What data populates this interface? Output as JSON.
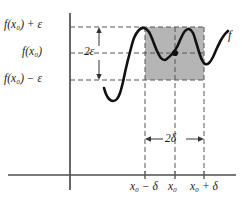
{
  "figure": {
    "curve_label": "f",
    "axes": {
      "x_axis_name": "x-axis",
      "y_axis_name": "y-axis"
    },
    "colors": {
      "shaded_band": "#b5b5b5",
      "curve": "#111111",
      "axis": "#4d4d4d",
      "dashed_guide": "#555555",
      "text": "#1a1a1a"
    },
    "y_labels": {
      "upper": "f(x₀) + ε",
      "center": "f(x₀)",
      "lower": "f(x₀) − ε"
    },
    "x_labels": {
      "left": "x₀ − δ",
      "center": "x₀",
      "right": "x₀ + δ"
    },
    "annotations": {
      "vertical_extent": "2ε",
      "horizontal_extent": "2δ"
    },
    "marked_point": {
      "name": "point-x0-fx0",
      "x_label": "x₀",
      "y_label": "f(x₀)"
    }
  },
  "chart_data": {
    "type": "line",
    "xlabel": "",
    "ylabel": "",
    "grid": false,
    "legend": "none",
    "xlim": [
      0,
      245
    ],
    "ylim": [
      205,
      0
    ],
    "axis_pixels": {
      "x_axis_y": 175,
      "y_axis_x": 70,
      "y_axis_top": 13,
      "y_axis_bottom": 190,
      "x_axis_left": 8,
      "x_axis_right": 236
    },
    "guides": {
      "y_upper": 27,
      "y_center": 53,
      "y_lower": 80,
      "x_left": 145,
      "x_center": 175,
      "x_right": 204
    },
    "shaded_rect": {
      "x": 145,
      "y": 27,
      "width": 59,
      "height": 53
    },
    "ticks": {
      "x": [
        145,
        175,
        204
      ],
      "x_tick_labels": [
        "x₀ − δ",
        "x₀",
        "x₀ + δ"
      ],
      "y_tick_labels": [
        "f(x₀) − ε",
        "f(x₀)",
        "f(x₀) + ε"
      ]
    },
    "series": [
      {
        "name": "f",
        "comment": "oscillating curve; pixel path points (x,y)",
        "points": [
          [
            104,
            88
          ],
          [
            106,
            94
          ],
          [
            109,
            99
          ],
          [
            113,
            101
          ],
          [
            117,
            99
          ],
          [
            120,
            93
          ],
          [
            123,
            82
          ],
          [
            126,
            68
          ],
          [
            130,
            52
          ],
          [
            134,
            38
          ],
          [
            139,
            30
          ],
          [
            144,
            28
          ],
          [
            149,
            32
          ],
          [
            153,
            41
          ],
          [
            157,
            51
          ],
          [
            161,
            58
          ],
          [
            165,
            60
          ],
          [
            169,
            57
          ],
          [
            173,
            53
          ],
          [
            177,
            47
          ],
          [
            181,
            38
          ],
          [
            185,
            31
          ],
          [
            189,
            29
          ],
          [
            193,
            33
          ],
          [
            196,
            42
          ],
          [
            199,
            52
          ],
          [
            202,
            60
          ],
          [
            205,
            64
          ],
          [
            209,
            63
          ],
          [
            213,
            57
          ],
          [
            217,
            48
          ],
          [
            221,
            40
          ],
          [
            225,
            34
          ],
          [
            228,
            31
          ]
        ]
      }
    ],
    "marked_point_pixel": [
      175,
      53
    ]
  }
}
